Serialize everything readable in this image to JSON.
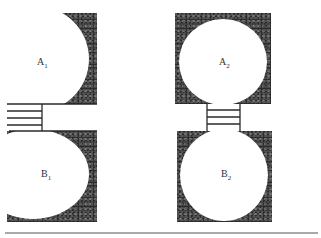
{
  "diagram": {
    "left_pair": {
      "top": {
        "label": "A",
        "sub": "1"
      },
      "bottom": {
        "label": "B",
        "sub": "1"
      },
      "connector": "horizontal-rungs-left"
    },
    "right_pair": {
      "top": {
        "label": "A",
        "sub": "2"
      },
      "bottom": {
        "label": "B",
        "sub": "2"
      },
      "connector": "ladder-vertical-center"
    }
  },
  "colors": {
    "ink": "#2a2a2a",
    "background": "#ffffff"
  }
}
